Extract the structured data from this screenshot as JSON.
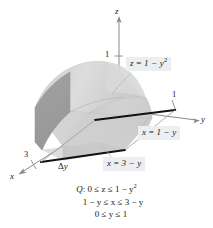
{
  "figure": {
    "axes": {
      "x": {
        "label": "x",
        "tick_label": "3",
        "tick_value": 3
      },
      "y": {
        "label": "y",
        "tick_label": "1",
        "tick_value": 1
      },
      "z": {
        "label": "z",
        "tick_label": "1",
        "tick_value": 1
      }
    },
    "slice_label": {
      "delta": "Δ",
      "variable": "y",
      "full": "Δy"
    },
    "callouts": [
      {
        "id": "top-surface",
        "lhs": "z",
        "eq": "=",
        "rhs": "1 − y",
        "exponent": "2",
        "full": "z = 1 − y²"
      },
      {
        "id": "front-plane",
        "lhs": "x",
        "eq": "=",
        "rhs": "1 − y",
        "exponent": "",
        "full": "x = 1 − y"
      },
      {
        "id": "back-plane",
        "lhs": "x",
        "eq": "=",
        "rhs": "3 − y",
        "exponent": "",
        "full": "x = 3 − y"
      }
    ],
    "caption": {
      "region_name": "Q",
      "colon": ":",
      "line1_pre": "0 ≤ z ≤ 1 − y",
      "line1_sup": "2",
      "line2": "1 − y ≤ x ≤ 3 − y",
      "line3": "0 ≤ y ≤ 1",
      "full": "Q: 0 ≤ z ≤ 1 − y²,  1 − y ≤ x ≤ 3 − y,  0 ≤ y ≤ 1"
    },
    "colors": {
      "background": "#ffffff",
      "surface_light": "#d9d9d9",
      "surface_mid": "#c9c9c9",
      "surface_dark": "#a3a3a3",
      "surface_darkest": "#8f8f8f",
      "edge_black": "#111111",
      "axis_gray": "#7a7a7a",
      "callout_bg": "#eceff2",
      "text": "#1a1a1a"
    }
  }
}
